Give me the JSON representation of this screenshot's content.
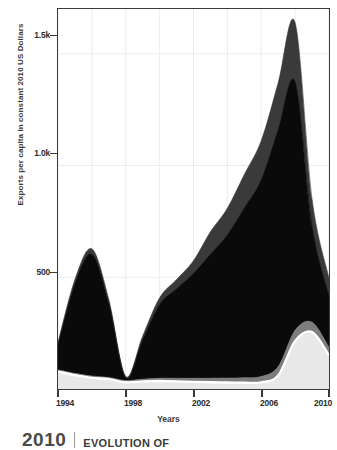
{
  "chart_data": {
    "type": "area",
    "title": "",
    "subtitle": "",
    "xlabel": "Years",
    "ylabel": "Exports per capita in constant 2010 US Dollars",
    "xlim": [
      1994,
      2010
    ],
    "ylim": [
      0,
      1700
    ],
    "grid": true,
    "stacked": true,
    "legend_position": "none",
    "x": [
      1994,
      1995,
      1996,
      1997,
      1998,
      1999,
      2000,
      2001,
      2002,
      2003,
      2004,
      2005,
      2006,
      2007,
      2008,
      2009,
      2010
    ],
    "x_tick_labels": [
      "1994",
      "1998",
      "2002",
      "2006",
      "2010"
    ],
    "x_tick_values": [
      1994,
      1998,
      2002,
      2006,
      2010
    ],
    "x_minor_tick_values": [
      1996,
      2000,
      2004,
      2008
    ],
    "y_tick_labels": [
      "500",
      "1.0k",
      "1.5k"
    ],
    "y_tick_values": [
      500,
      1000,
      1500
    ],
    "series": [
      {
        "name": "bottom-light-band",
        "color": "#e8e8e8",
        "values": [
          78,
          62,
          50,
          44,
          30,
          34,
          36,
          34,
          32,
          30,
          29,
          28,
          30,
          60,
          215,
          255,
          150
        ]
      },
      {
        "name": "mid-grey-band",
        "color": "#7d7d7d",
        "values": [
          8,
          8,
          8,
          8,
          8,
          10,
          12,
          14,
          16,
          18,
          20,
          22,
          26,
          40,
          48,
          44,
          36
        ]
      },
      {
        "name": "main-black-band",
        "color": "#0a0a0a",
        "values": [
          110,
          400,
          545,
          330,
          12,
          175,
          330,
          400,
          470,
          555,
          640,
          760,
          880,
          1060,
          1110,
          430,
          230
        ]
      },
      {
        "name": "top-dark-grey-band",
        "color": "#3a3a3a",
        "values": [
          12,
          20,
          24,
          18,
          6,
          18,
          30,
          42,
          56,
          100,
          120,
          150,
          175,
          210,
          265,
          120,
          80
        ]
      }
    ],
    "totals": [
      208,
      490,
      627,
      400,
      56,
      237,
      408,
      490,
      574,
      703,
      809,
      960,
      1111,
      1370,
      1638,
      849,
      496
    ],
    "annotations": []
  },
  "axis": {
    "y_title": "Exports per capita in constant 2010 US Dollars",
    "x_title": "Years",
    "y_ticks": [
      {
        "label": "1.5k",
        "value": 1500
      },
      {
        "label": "1.0k",
        "value": 1000
      },
      {
        "label": "500",
        "value": 500
      }
    ],
    "x_ticks": [
      {
        "label": "1994",
        "value": 1994,
        "major": true
      },
      {
        "label": "",
        "value": 1996,
        "major": false
      },
      {
        "label": "1998",
        "value": 1998,
        "major": true
      },
      {
        "label": "",
        "value": 2000,
        "major": false
      },
      {
        "label": "2002",
        "value": 2002,
        "major": true
      },
      {
        "label": "",
        "value": 2004,
        "major": false
      },
      {
        "label": "2006",
        "value": 2006,
        "major": true
      },
      {
        "label": "",
        "value": 2008,
        "major": false
      },
      {
        "label": "2010",
        "value": 2010,
        "major": true
      }
    ]
  },
  "footer": {
    "year": "2010",
    "title": "EVOLUTION OF"
  },
  "colors": {
    "axis": "#3a3a3a",
    "grid": "#ececec",
    "band_light": "#e8e8e8",
    "band_mid_grey": "#7d7d7d",
    "band_black": "#0a0a0a",
    "band_dark_grey": "#3a3a3a",
    "separator_white": "#ffffff",
    "background": "#ffffff"
  }
}
